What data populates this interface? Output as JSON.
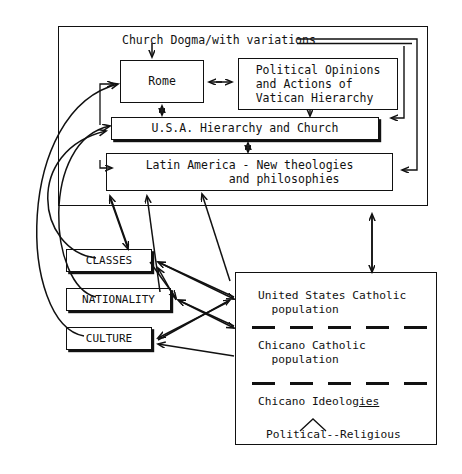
{
  "diagram": {
    "title_label": "Church Dogma/with variations",
    "outer_frame_name": "church-institutional-frame",
    "boxes": {
      "rome": {
        "label": "Rome"
      },
      "political": {
        "label": "Political Opinions\nand Actions of\nVatican Hierarchy"
      },
      "usa": {
        "label": "U.S.A. Hierarchy and Church"
      },
      "latin": {
        "label": "Latin America - New theologies\n            and philosophies"
      },
      "classes": {
        "label": "CLASSES"
      },
      "nationality": {
        "label": "NATIONALITY"
      },
      "culture": {
        "label": "CULTURE"
      }
    },
    "population_box": {
      "united_states": "United States Catholic\n  population",
      "chicano": "Chicano Catholic\n  population",
      "ideologies_prefix": "Chicano Ideolog",
      "ideologies_underlined": "ies",
      "political_religious": "Political--Religious",
      "separator_dash_count": 5
    },
    "colors": {
      "ink": "#111111",
      "background": "#ffffff"
    },
    "arrows": [
      {
        "name": "dogma-to-rome",
        "kind": "single-down"
      },
      {
        "name": "rome-political-bidirectional",
        "kind": "double-horizontal"
      },
      {
        "name": "rome-usa-bidirectional",
        "kind": "double-vertical"
      },
      {
        "name": "political-to-usa",
        "kind": "single-down"
      },
      {
        "name": "usa-latin-bidirectional",
        "kind": "double-vertical"
      },
      {
        "name": "dogma-return-to-usa",
        "kind": "single-left"
      },
      {
        "name": "dogma-return-to-latin",
        "kind": "single-left"
      },
      {
        "name": "latin-classes-bidirectional",
        "kind": "double-diagonal"
      },
      {
        "name": "nationality-to-latin",
        "kind": "single-up"
      },
      {
        "name": "population-to-latin",
        "kind": "single-up"
      },
      {
        "name": "latin-frame-population-bidirectional",
        "kind": "double-vertical"
      },
      {
        "name": "classes-to-population",
        "kind": "double-diagonal"
      },
      {
        "name": "nationality-to-population",
        "kind": "double-diagonal"
      },
      {
        "name": "culture-to-population",
        "kind": "single-left"
      },
      {
        "name": "classes-to-rome-curve",
        "kind": "curved-up"
      },
      {
        "name": "nationality-to-usa-curve",
        "kind": "curved-up"
      },
      {
        "name": "culture-to-latin-curve",
        "kind": "curved-up"
      }
    ]
  }
}
